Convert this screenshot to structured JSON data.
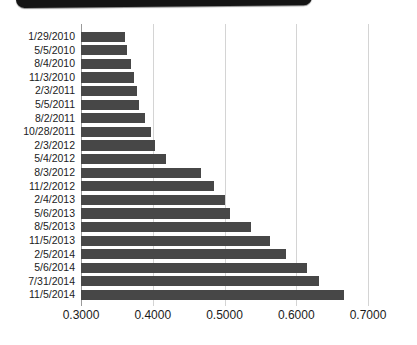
{
  "top_bar": {
    "label": "device-top-edge",
    "color": "#141414"
  },
  "chart_data": {
    "type": "bar",
    "orientation": "horizontal",
    "title": "",
    "subtitle": "",
    "xlabel": "",
    "ylabel": "",
    "xlim": [
      0.3,
      0.7
    ],
    "xticks": [
      "0.3000",
      "0.4000",
      "0.5000",
      "0.6000",
      "0.7000"
    ],
    "xtick_values": [
      0.3,
      0.4,
      0.5,
      0.6,
      0.7
    ],
    "grid": "vertical",
    "legend": null,
    "bar_color": "#474747",
    "gridline_color": "#d4d4d4",
    "categories": [
      "1/29/2010",
      "5/5/2010",
      "8/4/2010",
      "11/3/2010",
      "2/3/2011",
      "5/5/2011",
      "8/2/2011",
      "10/28/2011",
      "2/3/2012",
      "5/4/2012",
      "8/3/2012",
      "11/2/2012",
      "2/4/2013",
      "5/6/2013",
      "8/5/2013",
      "11/5/2013",
      "2/5/2014",
      "5/6/2014",
      "7/31/2014",
      "11/5/2014"
    ],
    "values": [
      0.3613,
      0.3641,
      0.3697,
      0.3739,
      0.3781,
      0.3809,
      0.3892,
      0.3976,
      0.4031,
      0.4185,
      0.4673,
      0.4854,
      0.5,
      0.507,
      0.5369,
      0.5634,
      0.5857,
      0.615,
      0.6318,
      0.6672
    ]
  }
}
